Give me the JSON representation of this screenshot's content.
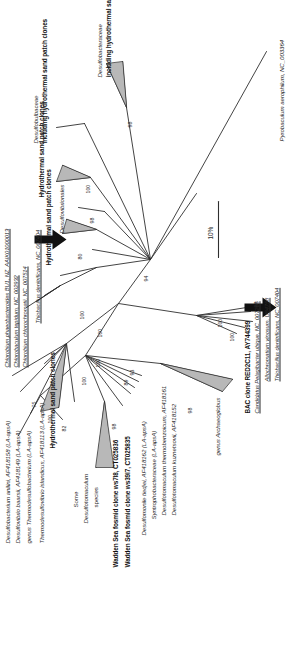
{
  "figure": {
    "type": "phylogenetic-tree",
    "orientation": "rotated-90-ccw",
    "scale_bar": {
      "label": "10%",
      "meaning": "10 percent sequence divergence"
    },
    "arrows": [
      {
        "id": "arrow-thiobacillus-upper",
        "points_to": "Thiobacillus denitrificans, NC_007404"
      },
      {
        "id": "arrow-thiobacillus-lower",
        "points_to": "Thiobacillus denitrificans, NC_007404"
      }
    ]
  },
  "taxa": [
    {
      "id": "t01",
      "label": "Desulfobacterium anilini, AF418158 (LA-apsA)",
      "style": "italic-partial"
    },
    {
      "id": "t02",
      "label": "Desulfovibrio baarsii, AF418149 (LA-apsA)",
      "style": "italic-partial"
    },
    {
      "id": "t03",
      "label": "genus Thermodesulfobacterium (LA-apsA)",
      "style": "italic-partial"
    },
    {
      "id": "t04",
      "label": "Thermodesulfovibrio islandicus, AF418113 (LA-apsA)",
      "style": "italic-partial"
    },
    {
      "id": "t05",
      "label": "Hydrothermal sand patch clones",
      "style": "bold"
    },
    {
      "id": "t06",
      "label": "Chlorobium phaeobacteroides BU1, NZ_AAIK01000013",
      "style": "italic-underline"
    },
    {
      "id": "t07",
      "label": "Chlorobaculum tepidum, NC_002932",
      "style": "italic-underline"
    },
    {
      "id": "t08",
      "label": "Chlorobium chlorochromatii, NC_007514",
      "style": "italic-underline"
    },
    {
      "id": "t09",
      "label": "Thiobacillus denitrificans, NC_007404",
      "style": "italic-underline"
    },
    {
      "id": "t10",
      "label": "Hydrothermal sand patch clones",
      "style": "bold"
    },
    {
      "id": "t11",
      "label": "Desulfovibrionales",
      "style": "italic"
    },
    {
      "id": "t12",
      "label": "Hydrothermal sand patch clones",
      "style": "bold"
    },
    {
      "id": "t13",
      "label": "Desulfobulbaceae",
      "style": "italic"
    },
    {
      "id": "t14",
      "label": "including hydrothermal sand patch clones",
      "style": "bold"
    },
    {
      "id": "t15",
      "label": "Desulfobacteraceae",
      "style": "italic"
    },
    {
      "id": "t16",
      "label": "including hydrothermal sand patch clones",
      "style": "bold"
    },
    {
      "id": "t17",
      "label": "Some",
      "style": "plain"
    },
    {
      "id": "t18",
      "label": "Desulfotomaculum",
      "style": "italic"
    },
    {
      "id": "t19",
      "label": "species",
      "style": "plain"
    },
    {
      "id": "t20",
      "label": "Wadden Sea fosmid clone ws7l8, CT025836",
      "style": "bold"
    },
    {
      "id": "t21",
      "label": "Wadden Sea fosmid clone ws39l7, CT025835",
      "style": "bold"
    },
    {
      "id": "t22",
      "label": "Desulfomonile tiedjei, AF418162 (LA-apsA)",
      "style": "italic-partial"
    },
    {
      "id": "t23",
      "label": "Syntrophobacteraceae (LA-apsA)",
      "style": "italic-partial"
    },
    {
      "id": "t24",
      "label": "Desulfotomaculum thermobenzoicum, AF418161",
      "style": "italic-partial"
    },
    {
      "id": "t25",
      "label": "Desulfotomaculum kuznetsovii, AF418152",
      "style": "italic-partial"
    },
    {
      "id": "t26",
      "label": "genus Archaeoglobus",
      "style": "italic-partial"
    },
    {
      "id": "t27",
      "label": "BAC clone RED2C11, AY744399",
      "style": "bold"
    },
    {
      "id": "t28",
      "label": "Candidatus Pelagibacter ubique, NC_007205",
      "style": "italic-underline"
    },
    {
      "id": "t29",
      "label": "Allochromatium vinosum, U84758",
      "style": "italic-underline"
    },
    {
      "id": "t30",
      "label": "Thiobacillus denitrificans, NC_007404",
      "style": "italic-underline"
    },
    {
      "id": "t31",
      "label": "Pyrobaculum aerophilum, NC_003364",
      "style": "italic-partial"
    }
  ],
  "bootstrap_values": [
    {
      "id": "b01",
      "value": "100"
    },
    {
      "id": "b02",
      "value": "75"
    },
    {
      "id": "b03",
      "value": "82"
    },
    {
      "id": "b04",
      "value": "98"
    },
    {
      "id": "b05",
      "value": "100"
    },
    {
      "id": "b06",
      "value": "89"
    },
    {
      "id": "b07",
      "value": "93"
    },
    {
      "id": "b08",
      "value": "98"
    },
    {
      "id": "b09",
      "value": "100"
    },
    {
      "id": "b10",
      "value": "100"
    },
    {
      "id": "b11",
      "value": "100"
    },
    {
      "id": "b12",
      "value": "80"
    },
    {
      "id": "b13",
      "value": "98"
    },
    {
      "id": "b14",
      "value": "100"
    },
    {
      "id": "b15",
      "value": "98"
    },
    {
      "id": "b16",
      "value": "94"
    },
    {
      "id": "b17",
      "value": "100"
    },
    {
      "id": "b18",
      "value": "100"
    },
    {
      "id": "b19",
      "value": "98"
    }
  ]
}
